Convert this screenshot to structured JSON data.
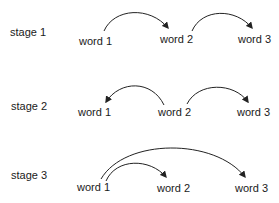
{
  "diagram": {
    "stages": [
      {
        "label": "stage 1",
        "words": [
          "word 1",
          "word 2",
          "word 3"
        ],
        "arcs": [
          {
            "from": "word 1",
            "to": "word 2"
          },
          {
            "from": "word 2",
            "to": "word 3"
          }
        ]
      },
      {
        "label": "stage 2",
        "words": [
          "word 1",
          "word 2",
          "word 3"
        ],
        "arcs": [
          {
            "from": "word 2",
            "to": "word 1"
          },
          {
            "from": "word 2",
            "to": "word 3"
          }
        ]
      },
      {
        "label": "stage 3",
        "words": [
          "word 1",
          "word 2",
          "word 3"
        ],
        "arcs": [
          {
            "from": "word 1",
            "to": "word 2"
          },
          {
            "from": "word 1",
            "to": "word 3"
          }
        ]
      }
    ],
    "colors": {
      "text": "#1a1a1a",
      "arrow": "#222222",
      "background": "#ffffff"
    }
  }
}
